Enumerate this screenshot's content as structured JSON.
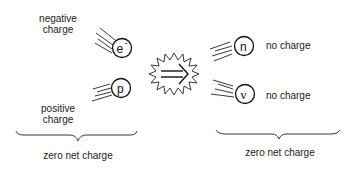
{
  "diagram": {
    "left_side": {
      "particles": [
        {
          "symbol": "e",
          "superscript": "-",
          "label_line1": "negative",
          "label_line2": "charge"
        },
        {
          "symbol": "p",
          "superscript": "",
          "label_line1": "positive",
          "label_line2": "charge"
        }
      ],
      "brace_label": "zero net charge"
    },
    "reaction_arrow": {
      "glyph": "⇒",
      "icon": "starburst-arrow-icon"
    },
    "right_side": {
      "particles": [
        {
          "symbol": "n",
          "label": "no charge"
        },
        {
          "symbol": "ν",
          "label": "no charge"
        }
      ],
      "brace_label": "zero net charge"
    }
  }
}
